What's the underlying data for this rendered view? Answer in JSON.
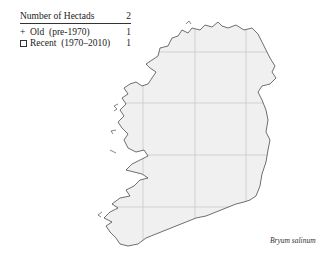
{
  "legend": {
    "header_label": "Number of Hectads",
    "header_value": "2",
    "rows": [
      {
        "symbol": "plus",
        "symbol_char": "+",
        "label": "Old  (pre-1970)",
        "value": "1"
      },
      {
        "symbol": "square",
        "symbol_char": "□",
        "label": "Recent  (1970–2010)",
        "value": "1"
      }
    ]
  },
  "map": {
    "region": "Ireland",
    "land_color": "#f0f0f0",
    "coast_color": "#333333",
    "grid_color": "#c8c8c8",
    "grid_x": [
      143,
      195,
      246
    ],
    "grid_y": [
      52,
      103,
      155,
      207
    ]
  },
  "species_name": "Bryum salinum"
}
